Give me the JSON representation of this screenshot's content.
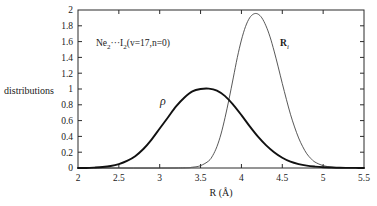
{
  "chart_data": {
    "type": "line",
    "title": "",
    "xlabel": "R (Å)",
    "ylabel": "distributions",
    "xlim": [
      2,
      5.5
    ],
    "ylim": [
      0,
      2
    ],
    "grid": false,
    "legend_position": "inline-annotations",
    "xticks": [
      "2",
      "2.5",
      "3",
      "3.5",
      "4",
      "4.5",
      "5",
      "5.5"
    ],
    "xtick_values": [
      2,
      2.5,
      3,
      3.5,
      4,
      4.5,
      5,
      5.5
    ],
    "yticks": [
      "0",
      "0.2",
      "0.4",
      "0.6",
      "0.8",
      "1",
      "1.2",
      "1.4",
      "1.6",
      "1.8",
      "2"
    ],
    "ytick_values": [
      0,
      0.2,
      0.4,
      0.6,
      0.8,
      1.0,
      1.2,
      1.4,
      1.6,
      1.8,
      2.0
    ],
    "annotations": [
      {
        "name": "system-label",
        "text": "Ne2···I2(v=17,n=0)",
        "x": 2.65,
        "y": 1.62
      },
      {
        "name": "rho-curve-label",
        "text": "ρ",
        "x": 3.12,
        "y": 0.78
      },
      {
        "name": "ri-curve-label",
        "text": "Ri",
        "x": 4.52,
        "y": 1.62
      }
    ],
    "series": [
      {
        "name": "ρ",
        "label": "rho",
        "color": "#111111",
        "linewidth": 1.9,
        "peak_x": 3.6,
        "peak_y": 1.0,
        "x": [
          2.0,
          2.1,
          2.2,
          2.3,
          2.4,
          2.5,
          2.6,
          2.7,
          2.8,
          2.9,
          3.0,
          3.1,
          3.2,
          3.3,
          3.4,
          3.5,
          3.6,
          3.7,
          3.8,
          3.9,
          4.0,
          4.1,
          4.2,
          4.3,
          4.4,
          4.5,
          4.6,
          4.7,
          4.8,
          4.9,
          5.0,
          5.1,
          5.2,
          5.3,
          5.4,
          5.5
        ],
        "y": [
          0.0,
          0.0,
          0.005,
          0.012,
          0.025,
          0.05,
          0.09,
          0.15,
          0.24,
          0.36,
          0.5,
          0.64,
          0.78,
          0.89,
          0.97,
          1.0,
          1.005,
          0.98,
          0.91,
          0.8,
          0.67,
          0.53,
          0.4,
          0.29,
          0.2,
          0.13,
          0.08,
          0.05,
          0.03,
          0.018,
          0.01,
          0.006,
          0.003,
          0.002,
          0.001,
          0.0
        ]
      },
      {
        "name": "Ri",
        "label": "R_i",
        "color": "#3a3a3a",
        "linewidth": 0.85,
        "peak_x": 4.2,
        "peak_y": 1.95,
        "x": [
          2.0,
          3.2,
          3.4,
          3.5,
          3.6,
          3.65,
          3.7,
          3.75,
          3.8,
          3.85,
          3.9,
          3.95,
          4.0,
          4.05,
          4.1,
          4.15,
          4.2,
          4.25,
          4.3,
          4.35,
          4.4,
          4.45,
          4.5,
          4.55,
          4.6,
          4.65,
          4.7,
          4.75,
          4.8,
          4.85,
          4.9,
          5.0,
          5.1,
          5.2,
          5.5
        ],
        "y": [
          0.0,
          0.0,
          0.01,
          0.03,
          0.09,
          0.16,
          0.27,
          0.43,
          0.64,
          0.88,
          1.14,
          1.4,
          1.62,
          1.79,
          1.9,
          1.95,
          1.95,
          1.9,
          1.8,
          1.66,
          1.48,
          1.28,
          1.07,
          0.87,
          0.68,
          0.52,
          0.38,
          0.27,
          0.18,
          0.12,
          0.075,
          0.03,
          0.012,
          0.005,
          0.0
        ]
      }
    ]
  },
  "plot_geometry": {
    "left": 78,
    "right": 364,
    "top": 10,
    "bottom": 168
  }
}
